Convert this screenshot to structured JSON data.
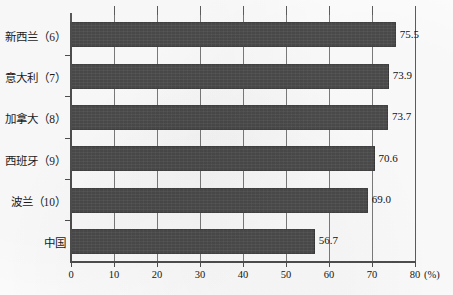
{
  "chart_data": {
    "type": "bar",
    "orientation": "horizontal",
    "title": "",
    "xlabel": "(%)",
    "ylabel": "",
    "xlim": [
      0,
      80
    ],
    "xticks": [
      "0",
      "10",
      "20",
      "30",
      "40",
      "50",
      "60",
      "70",
      "80"
    ],
    "xtick_values": [
      0,
      10,
      20,
      30,
      40,
      50,
      60,
      70,
      80
    ],
    "grid": true,
    "grid_axis": "x",
    "legend": false,
    "unit": "(%)",
    "categories": [
      "新西兰（6）",
      "意大利（7）",
      "加拿大（8）",
      "西班牙（9）",
      "波兰（10）",
      "中国"
    ],
    "values": [
      75.5,
      73.9,
      73.7,
      70.6,
      69.0,
      56.7
    ],
    "value_labels": [
      "75.5",
      "73.9",
      "73.7",
      "70.6",
      "69.0",
      "56.7"
    ],
    "series": [
      {
        "name": "",
        "values": [
          75.5,
          73.9,
          73.7,
          70.6,
          69.0,
          56.7
        ]
      }
    ],
    "bar_color": "#4a4a4a",
    "axis_color": "#4e4e4e",
    "grid_color": "#7b7b7b",
    "background_color": "#fdfdfd"
  }
}
